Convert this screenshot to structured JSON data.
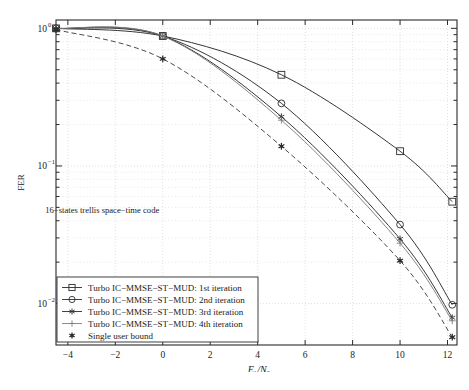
{
  "chart_data": {
    "type": "line",
    "title": "",
    "xlabel": "Eb/N0",
    "ylabel": "FER",
    "xlim": [
      -4.5,
      12.4
    ],
    "ylim": [
      0.005,
      1.15
    ],
    "yscale": "log",
    "grid": true,
    "legend_position": "lower-left",
    "annotation": "16−states trellis space−time code",
    "xticks": [
      "-4",
      "-2",
      "0",
      "2",
      "4",
      "6",
      "8",
      "10",
      "12"
    ],
    "xtick_values": [
      -4,
      -2,
      0,
      2,
      4,
      6,
      8,
      10,
      12
    ],
    "yticks": [
      "10^0",
      "10^-1",
      "10^-2"
    ],
    "ytick_values": [
      1,
      0.1,
      0.01
    ],
    "series": [
      {
        "name": "Turbo IC−MMSE−ST−MUD: 1st iteration",
        "marker": "square",
        "linestyle": "solid",
        "color": "#2b2b2b",
        "x": [
          -4.5,
          0,
          5,
          10,
          12.2
        ],
        "y": [
          1.0,
          0.88,
          0.46,
          0.128,
          0.055
        ]
      },
      {
        "name": "Turbo IC−MMSE−ST−MUD: 2nd iteration",
        "marker": "circle",
        "linestyle": "solid",
        "color": "#2b2b2b",
        "x": [
          -4.5,
          0,
          5,
          10,
          12.2
        ],
        "y": [
          1.0,
          0.88,
          0.285,
          0.0375,
          0.0098
        ]
      },
      {
        "name": "Turbo IC−MMSE−ST−MUD: 3rd iteration",
        "marker": "asterisk",
        "linestyle": "solid",
        "color": "#2b2b2b",
        "x": [
          -4.5,
          0,
          5,
          10,
          12.2
        ],
        "y": [
          1.0,
          0.88,
          0.228,
          0.0295,
          0.0079
        ]
      },
      {
        "name": "Turbo IC−MMSE−ST−MUD: 4th iteration",
        "marker": "plus",
        "linestyle": "solid",
        "color": "#7d7d7d",
        "x": [
          -4.5,
          0,
          5,
          10,
          12.2
        ],
        "y": [
          1.0,
          0.88,
          0.215,
          0.0275,
          0.0075
        ]
      },
      {
        "name": "Single user bound",
        "marker": "star",
        "linestyle": "dashed",
        "color": "#2b2b2b",
        "x": [
          -4.5,
          0,
          5,
          10,
          12.2
        ],
        "y": [
          0.98,
          0.6,
          0.139,
          0.0205,
          0.0057
        ]
      }
    ]
  },
  "axis": {
    "y_label": "FER",
    "x_label_main": "E",
    "x_label_sub1": "b",
    "x_label_slash": "/N",
    "x_label_sub2": "0"
  },
  "legend": {
    "entries": [
      "Turbo IC−MMSE−ST−MUD: 1st iteration",
      "Turbo IC−MMSE−ST−MUD: 2nd iteration",
      "Turbo IC−MMSE−ST−MUD: 3rd iteration",
      "Turbo IC−MMSE−ST−MUD: 4th iteration",
      "Single user bound"
    ]
  },
  "annotation": {
    "text": "16−states trellis space−time code"
  },
  "caption": {
    "text": ""
  },
  "colors": {
    "ink": "#2b2b2b",
    "grid": "#d4d4d4",
    "gray_series": "#7d7d7d",
    "background": "#ffffff"
  }
}
